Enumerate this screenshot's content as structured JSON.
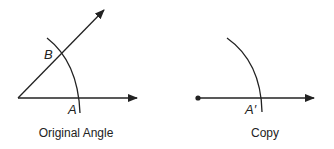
{
  "figures": [
    {
      "caption": "Original Angle",
      "labels": {
        "b": "B",
        "a": "A"
      }
    },
    {
      "caption": "Copy",
      "labels": {
        "a_prime": "A′"
      }
    }
  ],
  "colors": {
    "stroke": "#222222",
    "background": "#ffffff"
  }
}
